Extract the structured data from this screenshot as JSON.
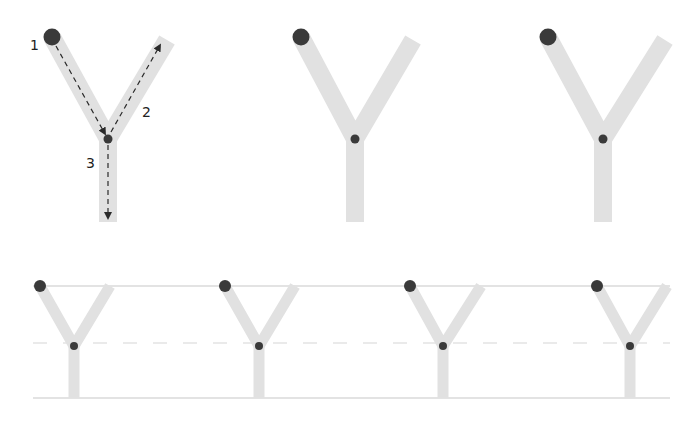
{
  "figure": {
    "colors": {
      "stroke_fill": "#e1e1e1",
      "dot": "#3a3a3a",
      "guide_line": "#c8c8c8",
      "dashed_line": "#d6d6d6",
      "arrow": "#2a2a2a"
    },
    "demo_letter": {
      "step_labels": [
        "1",
        "2",
        "3"
      ]
    },
    "top_row_letters": 3,
    "practice_row_letters": 4
  }
}
